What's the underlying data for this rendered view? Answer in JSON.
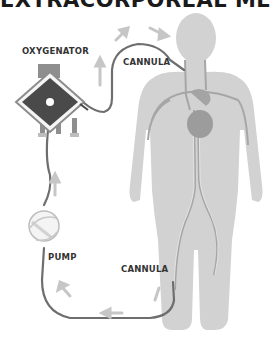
{
  "title": "EXTRACORPOREAL MEMBRANE OXYGENATION",
  "labels": {
    "oxygenator": "OXYGENATOR",
    "cannula_top": "CANNULA",
    "pump": "PUMP",
    "cannula_bottom": "CANNULA"
  },
  "colors": {
    "body": "#d0d0d0",
    "vessel": "#a8a8a8",
    "heart": "#9a9a9a",
    "tube": "#6e6e6e",
    "arrow": "#c4c4c4",
    "oxygenator_core": "#4a4a4a",
    "oxygenator_frame": "#8c8c8c",
    "label_text": "#333333"
  }
}
